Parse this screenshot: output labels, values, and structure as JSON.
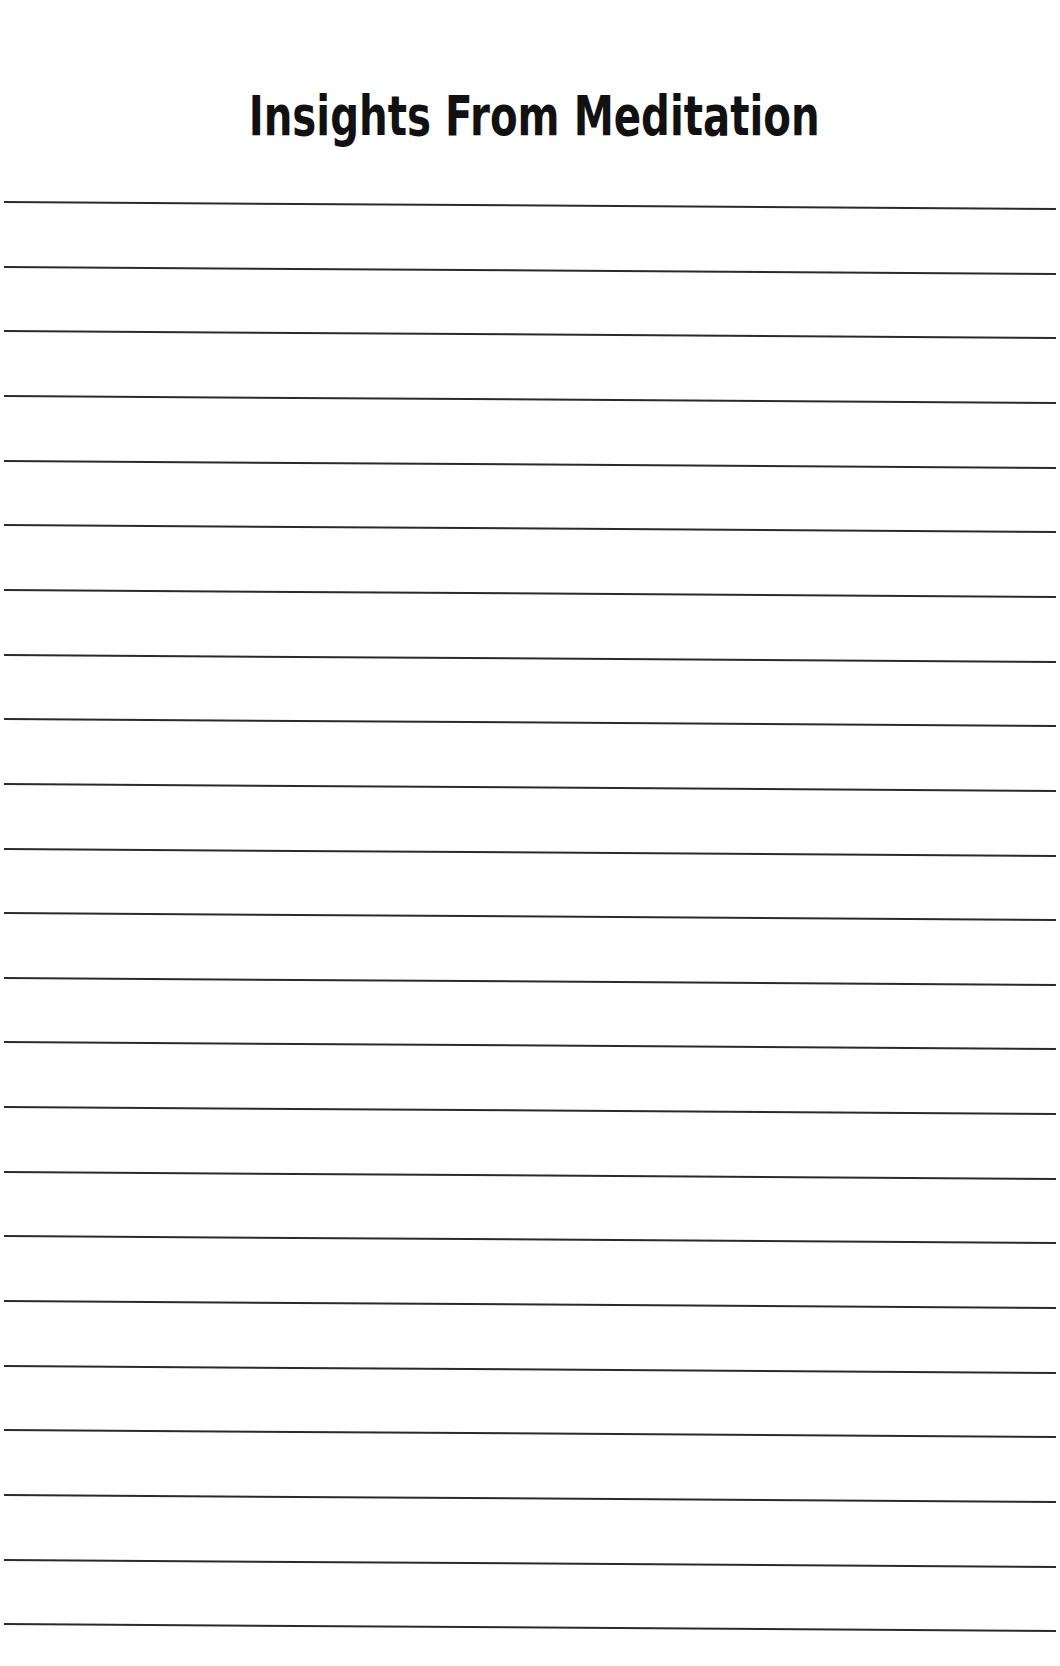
{
  "document": {
    "title": "Insights From Meditation",
    "line_count": 23,
    "first_line_y": 202,
    "line_spacing": 64.65,
    "line_color": "#2a2a2a",
    "background": "#ffffff"
  }
}
